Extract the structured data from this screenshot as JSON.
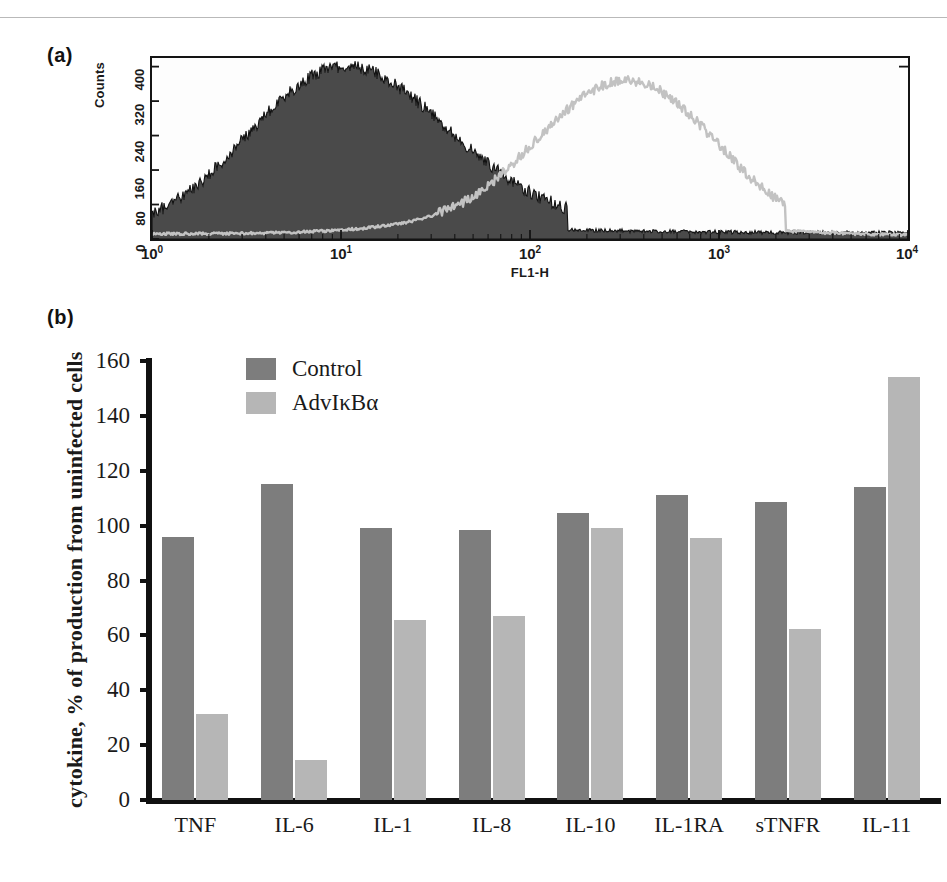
{
  "figure": {
    "panels": [
      {
        "tag": "(a)",
        "type": "histogram"
      },
      {
        "tag": "(b)",
        "type": "bar"
      }
    ]
  },
  "panel_a": {
    "label": "(a)",
    "ylabel": "Counts",
    "xlabel": "FL1-H",
    "yticks": [
      "0",
      "80",
      "160",
      "240",
      "320",
      "400"
    ],
    "xticks": [
      "10",
      "10",
      "10",
      "10",
      "10"
    ],
    "xtick_exponents": [
      "0",
      "1",
      "2",
      "3",
      "4"
    ],
    "series": [
      {
        "name": "unstained-filled",
        "style": "filled",
        "color": "#4a4a4a"
      },
      {
        "name": "stained-outline",
        "style": "line",
        "color": "#bdbdbd"
      }
    ]
  },
  "panel_b": {
    "label": "(b)",
    "legend": [
      {
        "label": "Control",
        "color": "#7d7d7d"
      },
      {
        "label": "AdvIκBα",
        "color": "#b6b6b6"
      }
    ]
  },
  "chart_data": {
    "type": "bar",
    "title": "",
    "xlabel": "",
    "ylabel": "cytokine, % of production from uninfected cells",
    "ylim": [
      0,
      160
    ],
    "yticks": [
      0,
      20,
      40,
      60,
      80,
      100,
      120,
      140,
      160
    ],
    "grid": false,
    "legend_position": "top-left-inside",
    "categories": [
      "TNF",
      "IL-6",
      "IL-1",
      "IL-8",
      "IL-10",
      "IL-1RA",
      "sTNFR",
      "IL-11"
    ],
    "series": [
      {
        "name": "Control",
        "color": "#7d7d7d",
        "values": [
          96,
          115,
          99,
          98.5,
          104.5,
          111,
          108.5,
          114
        ]
      },
      {
        "name": "AdvIκBα",
        "color": "#b6b6b6",
        "values": [
          31.5,
          14.5,
          65.5,
          67,
          99,
          95.5,
          62.5,
          154
        ]
      }
    ]
  }
}
